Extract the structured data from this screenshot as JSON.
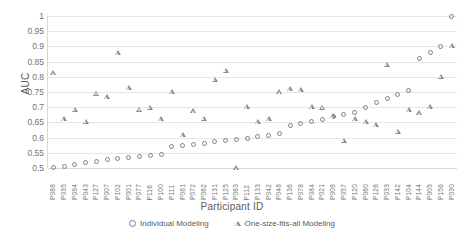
{
  "chart_data": {
    "type": "scatter",
    "title": "",
    "xlabel": "Participant ID",
    "ylabel": "AUC",
    "ylim": [
      0.5,
      1.0
    ],
    "ytick_labels": [
      "1",
      "0.95",
      "0.9",
      "0.85",
      "0.8",
      "0.75",
      "0.7",
      "0.65",
      "0.6",
      "0.55",
      "0.5"
    ],
    "ytick_values": [
      1,
      0.95,
      0.9,
      0.85,
      0.8,
      0.75,
      0.7,
      0.65,
      0.6,
      0.55,
      0.5
    ],
    "grid": true,
    "legend_position": "bottom",
    "categories": [
      "P088",
      "P035",
      "P094",
      "P043",
      "P127",
      "P007",
      "P102",
      "P001",
      "P077",
      "P116",
      "P100",
      "P111",
      "P081",
      "P072",
      "P062",
      "P131",
      "P125",
      "P063",
      "P112",
      "P133",
      "P042",
      "P048",
      "P136",
      "P078",
      "P084",
      "P021",
      "P008",
      "P057",
      "P120",
      "P060",
      "P126",
      "P033",
      "P142",
      "P104",
      "P144",
      "P005",
      "P156",
      "P030"
    ],
    "series": [
      {
        "name": "Individual Modeling",
        "marker": "circle",
        "values": [
          0.502,
          0.505,
          0.512,
          0.518,
          0.522,
          0.527,
          0.531,
          0.534,
          0.537,
          0.54,
          0.543,
          0.57,
          0.574,
          0.578,
          0.582,
          0.586,
          0.59,
          0.594,
          0.598,
          0.602,
          0.606,
          0.612,
          0.64,
          0.646,
          0.652,
          0.66,
          0.668,
          0.676,
          0.684,
          0.7,
          0.716,
          0.73,
          0.742,
          0.756,
          0.86,
          0.88,
          0.9,
          1.0
        ]
      },
      {
        "name": "One-size-fits-all Modeling",
        "marker": "triangle",
        "values": [
          0.812,
          0.66,
          0.692,
          0.652,
          0.745,
          0.732,
          0.878,
          0.763,
          0.692,
          0.698,
          0.66,
          0.75,
          0.608,
          0.686,
          0.662,
          0.79,
          0.82,
          0.5,
          0.7,
          0.65,
          0.66,
          0.75,
          0.76,
          0.755,
          0.7,
          0.698,
          0.67,
          0.59,
          0.66,
          0.65,
          0.64,
          0.84,
          0.62,
          0.69,
          0.68,
          0.7,
          0.8,
          0.9
        ]
      }
    ]
  },
  "legend": {
    "items": [
      {
        "label": "Individual Modeling",
        "marker": "circle"
      },
      {
        "label": "One-size-fits-all Modeling",
        "marker": "triangle"
      }
    ]
  },
  "colors": {
    "marker_circle": "#808080",
    "marker_triangle": "#8c8c8c",
    "gridline": "#e6e6e6",
    "axis": "#d9d9d9",
    "text": "#595959",
    "tick_text": "#737373",
    "background": "#ffffff"
  }
}
